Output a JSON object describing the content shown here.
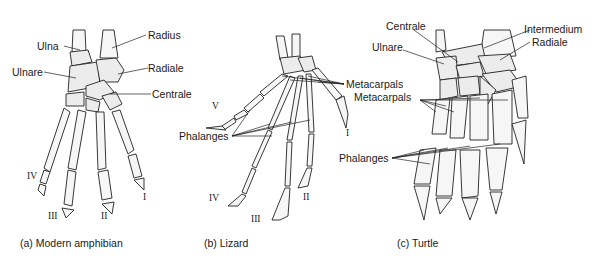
{
  "panels": [
    {
      "id": "amphibian",
      "caption": "(a) Modern amphibian",
      "labels": {
        "ulna": "Ulna",
        "radius": "Radius",
        "ulnare": "Ulnare",
        "radiale": "Radiale",
        "centrale": "Centrale"
      },
      "digits": [
        "I",
        "II",
        "III",
        "IV"
      ]
    },
    {
      "id": "lizard",
      "caption": "(b) Lizard",
      "labels": {
        "metacarpals": "Metacarpals",
        "phalanges": "Phalanges"
      },
      "digits": [
        "I",
        "II",
        "III",
        "IV",
        "V"
      ]
    },
    {
      "id": "turtle",
      "caption": "(c) Turtle",
      "labels": {
        "centrale": "Centrale",
        "intermedium": "Intermedium",
        "ulnare": "Ulnare",
        "radiale": "Radiale",
        "metacarpals": "Metacarpals",
        "phalanges": "Phalanges"
      }
    }
  ]
}
